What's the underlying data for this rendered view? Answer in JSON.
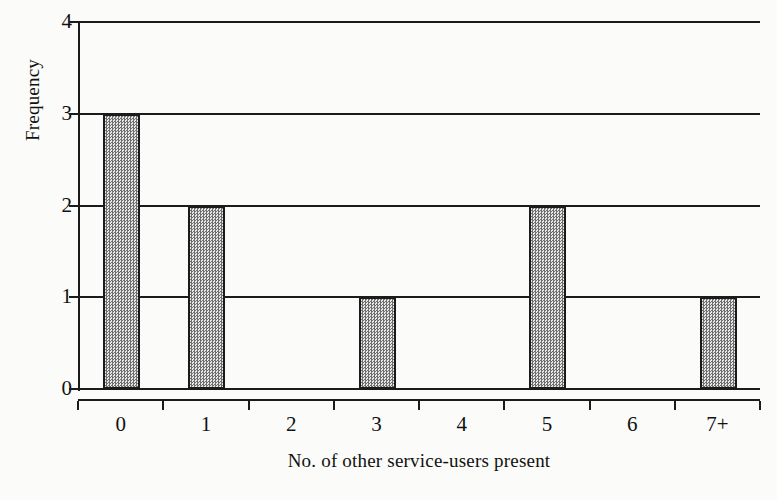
{
  "chart_data": {
    "type": "bar",
    "title": "",
    "subtitle": "",
    "xlabel": "No. of other service-users present",
    "ylabel": "Frequency",
    "categories": [
      "0",
      "1",
      "2",
      "3",
      "4",
      "5",
      "6",
      "7+"
    ],
    "values": [
      3,
      2,
      0,
      1,
      0,
      2,
      0,
      1
    ],
    "series": [
      {
        "name": "Frequency",
        "values": [
          3,
          2,
          0,
          1,
          0,
          2,
          0,
          1
        ]
      }
    ],
    "ylim": [
      0,
      4
    ],
    "yticks": [
      "0",
      "1",
      "2",
      "3",
      "4"
    ],
    "ytick_values": [
      0,
      1,
      2,
      3,
      4
    ],
    "xticks": [
      "0",
      "1",
      "2",
      "3",
      "4",
      "5",
      "6",
      "7+"
    ],
    "grid": true,
    "grid_axis": "y",
    "legend": false,
    "legend_position": "none",
    "annotations": [],
    "bar_fill": "#b9b9b9",
    "bar_edge": "#1b1b1b",
    "axis_color": "#1b1b1b",
    "background": "#fbfbf9"
  }
}
